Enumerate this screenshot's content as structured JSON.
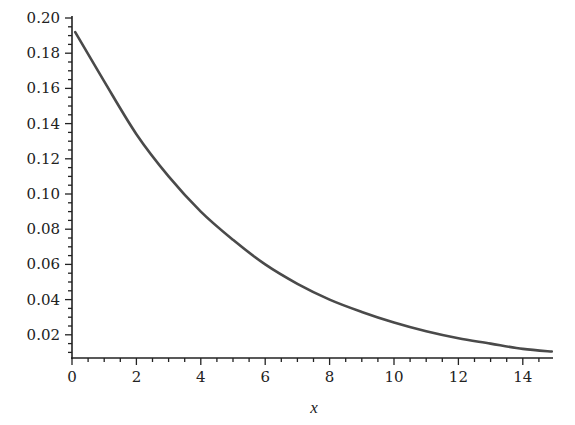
{
  "chart_data": {
    "type": "line",
    "title": "",
    "xlabel": "x",
    "ylabel": "",
    "xlim": [
      0,
      15
    ],
    "ylim": [
      0.0069,
      0.2
    ],
    "grid": false,
    "legend": null,
    "x_ticks": [
      0,
      2,
      4,
      6,
      8,
      10,
      12,
      14
    ],
    "x_tick_labels": [
      "0",
      "2",
      "4",
      "6",
      "8",
      "10",
      "12",
      "14"
    ],
    "y_ticks": [
      0.02,
      0.04,
      0.06,
      0.08,
      0.1,
      0.12,
      0.14,
      0.16,
      0.18,
      0.2
    ],
    "y_tick_labels": [
      "0.02",
      "0.04",
      "0.06",
      "0.08",
      "0.10",
      "0.12",
      "0.14",
      "0.16",
      "0.18",
      "0.20"
    ],
    "series": [
      {
        "name": "f(x)",
        "color": "#4a4a4a",
        "x": [
          0.1,
          1,
          2,
          3,
          4,
          5,
          6,
          7,
          8,
          9,
          10,
          11,
          12,
          13,
          14,
          14.9
        ],
        "y": [
          0.192,
          0.164,
          0.134,
          0.11,
          0.09,
          0.074,
          0.06,
          0.049,
          0.04,
          0.033,
          0.027,
          0.022,
          0.018,
          0.015,
          0.012,
          0.0105
        ]
      }
    ]
  }
}
